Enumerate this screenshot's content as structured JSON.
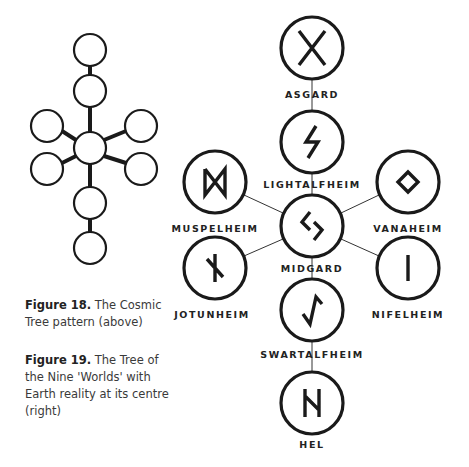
{
  "figure18": {
    "title": "Figure 18.",
    "caption": "The Cosmic Tree pattern (above)",
    "node_count": 9
  },
  "figure19": {
    "title": "Figure 19.",
    "caption": "The Tree of the Nine 'Worlds' with Earth reality at its centre (right)"
  },
  "worlds": [
    {
      "name": "ASGARD",
      "rune": "gebo"
    },
    {
      "name": "LIGHTALFHEIM",
      "rune": "sowilo"
    },
    {
      "name": "MUSPELHEIM",
      "rune": "dagaz"
    },
    {
      "name": "VANAHEIM",
      "rune": "ingwaz"
    },
    {
      "name": "MIDGARD",
      "rune": "jera"
    },
    {
      "name": "JOTUNHEIM",
      "rune": "nauthiz"
    },
    {
      "name": "NIFELHEIM",
      "rune": "isa"
    },
    {
      "name": "SWARTALFHEIM",
      "rune": "eihwaz"
    },
    {
      "name": "HEL",
      "rune": "hagalaz"
    }
  ],
  "colors": {
    "stroke": "#1a1a1a",
    "text": "#222222",
    "caption": "#3a3a3a",
    "background": "#ffffff"
  }
}
